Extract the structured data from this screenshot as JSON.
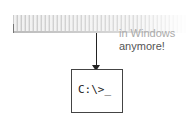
{
  "diagram": {
    "caption_line1": "in Windows",
    "caption_line2": "anymore!",
    "prompt_text": "C:\\>_",
    "colors": {
      "line": "#222222",
      "text": "#555555",
      "box_border": "#444444"
    }
  }
}
